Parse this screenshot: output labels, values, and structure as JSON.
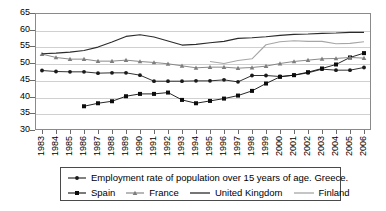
{
  "chart_data": {
    "type": "line",
    "title": "",
    "xlabel": "",
    "ylabel": "",
    "ylim": [
      30,
      65
    ],
    "ytick_step": 5,
    "yticks": [
      30,
      35,
      40,
      45,
      50,
      55,
      60,
      65
    ],
    "grid": true,
    "legend_position": "bottom",
    "x": [
      1983,
      1984,
      1985,
      1986,
      1987,
      1988,
      1989,
      1990,
      1991,
      1992,
      1993,
      1994,
      1995,
      1996,
      1997,
      1998,
      1999,
      2000,
      2001,
      2002,
      2003,
      2004,
      2005,
      2006
    ],
    "categories": [
      "1983",
      "1984",
      "1985",
      "1986",
      "1987",
      "1988",
      "1989",
      "1990",
      "1991",
      "1992",
      "1993",
      "1994",
      "1995",
      "1996",
      "1997",
      "1998",
      "1999",
      "2000",
      "2001",
      "2002",
      "2003",
      "2004",
      "2005",
      "2006"
    ],
    "series": [
      {
        "name": "Employment rate of population over 15 years of age. Greece.",
        "short_name": "Greece",
        "marker": "circle",
        "color": "#1a1a1a",
        "values": [
          47.8,
          47.5,
          47.4,
          47.4,
          47.0,
          47.1,
          47.1,
          46.4,
          44.6,
          44.6,
          44.6,
          44.7,
          44.7,
          45.0,
          44.4,
          46.3,
          46.3,
          46.0,
          46.4,
          47.1,
          48.2,
          47.9,
          47.9,
          48.7
        ]
      },
      {
        "name": "Spain",
        "short_name": "Spain",
        "marker": "square",
        "color": "#0d0d0d",
        "values": [
          null,
          null,
          null,
          37.1,
          38.0,
          38.6,
          40.1,
          40.8,
          40.8,
          41.2,
          39.0,
          38.0,
          38.7,
          39.4,
          40.3,
          41.7,
          43.9,
          45.9,
          46.4,
          47.3,
          48.4,
          49.6,
          51.7,
          53.0
        ]
      },
      {
        "name": "France",
        "short_name": "France",
        "marker": "triangle",
        "color": "#7d7d7d",
        "values": [
          52.7,
          51.7,
          51.2,
          51.2,
          50.6,
          50.6,
          50.9,
          50.5,
          50.2,
          49.8,
          49.2,
          48.6,
          48.8,
          48.8,
          48.5,
          48.7,
          49.1,
          49.9,
          50.5,
          50.9,
          51.3,
          51.4,
          51.7,
          51.5
        ]
      },
      {
        "name": "United Kingdom",
        "short_name": "United Kingdom",
        "marker": "none",
        "color": "#2b2b2b",
        "values": [
          52.8,
          53.0,
          53.3,
          53.8,
          54.8,
          56.3,
          58.0,
          58.5,
          57.8,
          56.6,
          55.4,
          55.6,
          56.1,
          56.5,
          57.4,
          57.6,
          57.9,
          58.3,
          58.6,
          58.7,
          58.9,
          59.0,
          59.2,
          59.2
        ]
      },
      {
        "name": "Finland",
        "short_name": "Finland",
        "marker": "none",
        "color": "#a6a6a6",
        "values": [
          null,
          null,
          null,
          null,
          null,
          null,
          null,
          null,
          null,
          null,
          null,
          null,
          50.5,
          49.9,
          50.8,
          51.3,
          55.5,
          56.4,
          56.7,
          56.5,
          56.5,
          55.8,
          55.9,
          56.4
        ]
      }
    ]
  },
  "legend": {
    "row1": [
      {
        "label": "Employment rate of population over 15 years of age. Greece.",
        "marker": "circle",
        "color": "#1a1a1a"
      }
    ],
    "row2": [
      {
        "label": "Spain",
        "marker": "square",
        "color": "#0d0d0d"
      },
      {
        "label": "France",
        "marker": "triangle",
        "color": "#7d7d7d"
      },
      {
        "label": "United Kingdom",
        "marker": "none",
        "color": "#2b2b2b"
      },
      {
        "label": "Finland",
        "marker": "none",
        "color": "#a6a6a6"
      }
    ]
  },
  "colors": {
    "grid": "#d0d0d0",
    "axis": "#8a8a8a",
    "background": "#ffffff",
    "text": "#000000"
  }
}
